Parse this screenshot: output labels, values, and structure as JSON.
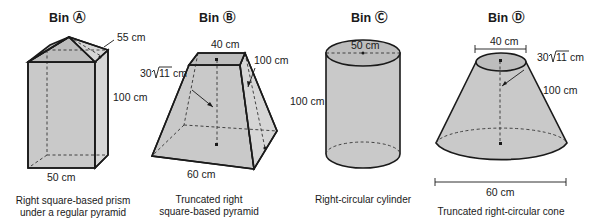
{
  "bins": [
    {
      "title": "Bin Ⓐ",
      "shape": "Right square-based prism under a regular pyramid",
      "caption_line1": "Right square-based prism",
      "caption_line2": "under a regular pyramid",
      "dimensions": {
        "slant_height": "55 cm",
        "height": "100 cm",
        "base": "50 cm"
      }
    },
    {
      "title": "Bin Ⓑ",
      "shape": "Truncated right square-based pyramid",
      "caption_line1": "Truncated right",
      "caption_line2": "square-based pyramid",
      "dimensions": {
        "top": "40 cm",
        "height_prefix": "30",
        "height_radicand": "11",
        "height_unit": "cm",
        "slant": "100 cm",
        "base": "60 cm"
      }
    },
    {
      "title": "Bin Ⓒ",
      "shape": "Right-circular cylinder",
      "caption_line1": "Right-circular cylinder",
      "dimensions": {
        "diameter": "50 cm",
        "height": "100 cm"
      }
    },
    {
      "title": "Bin Ⓓ",
      "shape": "Truncated right-circular cone",
      "caption_line1": "Truncated right-circular cone",
      "dimensions": {
        "top_diameter": "40 cm",
        "height_prefix": "30",
        "height_radicand": "11",
        "height_unit": "cm",
        "slant": "100 cm",
        "base_diameter": "60 cm"
      }
    }
  ]
}
